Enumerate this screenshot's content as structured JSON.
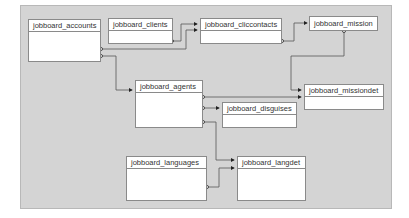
{
  "diagram": {
    "tables": [
      {
        "id": "accounts",
        "label": "jobboard_accounts"
      },
      {
        "id": "clients",
        "label": "jobboard_clients"
      },
      {
        "id": "cliccontacts",
        "label": "jobboard_cliccontacts"
      },
      {
        "id": "mission",
        "label": "jobboard_mission"
      },
      {
        "id": "missiondet",
        "label": "jobboard_missiondet"
      },
      {
        "id": "agents",
        "label": "jobboard_agents"
      },
      {
        "id": "disguises",
        "label": "jobboard_disguises"
      },
      {
        "id": "languages",
        "label": "jobboard_languages"
      },
      {
        "id": "langdet",
        "label": "jobboard_langdet"
      }
    ],
    "relations": [
      {
        "from": "clients",
        "to": "cliccontacts"
      },
      {
        "from": "accounts",
        "to": "cliccontacts"
      },
      {
        "from": "accounts",
        "to": "agents"
      },
      {
        "from": "cliccontacts",
        "to": "mission"
      },
      {
        "from": "mission",
        "to": "missiondet"
      },
      {
        "from": "agents",
        "to": "missiondet"
      },
      {
        "from": "agents",
        "to": "disguises"
      },
      {
        "from": "agents",
        "to": "langdet"
      },
      {
        "from": "languages",
        "to": "langdet"
      }
    ],
    "colors": {
      "canvas": "#d4d4d4",
      "line": "#555555",
      "box_border": "#8a8a8a"
    }
  }
}
